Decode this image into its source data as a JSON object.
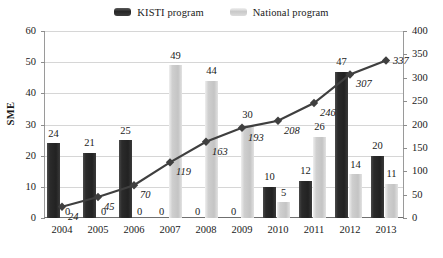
{
  "legend": {
    "items": [
      {
        "label": "KISTI program",
        "swatch": "kisti",
        "color": "#2b2b2b"
      },
      {
        "label": "National program",
        "swatch": "national",
        "color": "#c9c9c9"
      }
    ]
  },
  "axes": {
    "y_left_title": "SME",
    "y_left_ticks": [
      "0",
      "10",
      "20",
      "30",
      "40",
      "50",
      "60"
    ],
    "y_right_ticks": [
      "0",
      "50",
      "100",
      "150",
      "200",
      "250",
      "300",
      "350",
      "400"
    ]
  },
  "chart_data": {
    "type": "bar",
    "title": "",
    "xlabel": "",
    "ylabel": "SME",
    "ylim": [
      0,
      60
    ],
    "y2lim": [
      0,
      400
    ],
    "grid": true,
    "legend_position": "top-center",
    "categories": [
      "2004",
      "2005",
      "2006",
      "2007",
      "2008",
      "2009",
      "2010",
      "2011",
      "2012",
      "2013"
    ],
    "series": [
      {
        "name": "KISTI program",
        "type": "bar",
        "axis": "left",
        "color": "#2b2b2b",
        "values": [
          24,
          21,
          25,
          0,
          0,
          0,
          10,
          12,
          47,
          20
        ]
      },
      {
        "name": "National program",
        "type": "bar",
        "axis": "left",
        "color": "#c9c9c9",
        "values": [
          0,
          0,
          0,
          49,
          44,
          30,
          5,
          26,
          14,
          11
        ]
      },
      {
        "name": "Cumulative",
        "type": "line",
        "axis": "right",
        "color": "#3f3f3f",
        "marker": "diamond",
        "values": [
          24,
          45,
          70,
          119,
          163,
          193,
          208,
          246,
          307,
          337
        ]
      }
    ]
  }
}
